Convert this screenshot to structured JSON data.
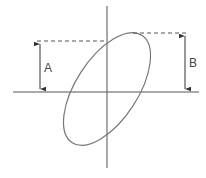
{
  "diagram": {
    "type": "lissajous-ellipse-measurement",
    "labels": {
      "a": "A",
      "b": "B"
    },
    "colors": {
      "line": "#555555",
      "ellipse": "#777777",
      "background": "#ffffff"
    }
  }
}
